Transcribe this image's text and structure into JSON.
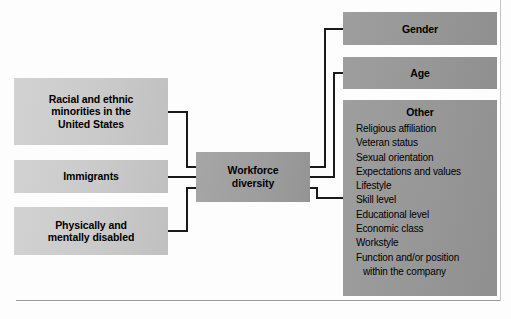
{
  "diagram": {
    "title": "Workforce diversity",
    "center": {
      "label_line1": "Workforce",
      "label_line2": "diversity"
    },
    "inputs": [
      {
        "name": "racial-and-ethnic-minorities",
        "line1": "Racial and ethnic",
        "line2": "minorities in the",
        "line3": "United States"
      },
      {
        "name": "immigrants",
        "line1": "Immigrants",
        "line2": "",
        "line3": ""
      },
      {
        "name": "physically-and-mentally-disabled",
        "line1": "Physically and",
        "line2": "mentally disabled",
        "line3": ""
      }
    ],
    "outputs": [
      {
        "name": "gender",
        "label": "Gender"
      },
      {
        "name": "age",
        "label": "Age"
      },
      {
        "name": "other",
        "label": "Other"
      }
    ],
    "other_items": [
      "Religious affiliation",
      "Veteran status",
      "Sexual orientation",
      "Expectations and values",
      "Lifestyle",
      "Skill level",
      "Educational level",
      "Economic class",
      "Workstyle",
      "Function and/or position",
      "within the company"
    ],
    "colors": {
      "input_box_fill": "#cacaca",
      "center_box_fill": "#9d9d9d",
      "output_box_fill": "#969696",
      "connector_line": "#1a1a1a",
      "text": "#000000",
      "page_rule": "#9a9a9a"
    }
  }
}
